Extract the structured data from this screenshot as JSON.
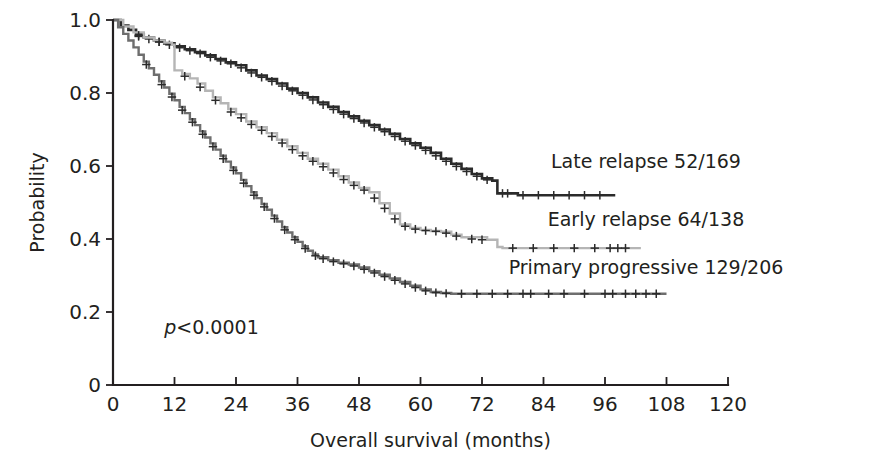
{
  "chart_data": {
    "type": "line",
    "subtype": "kaplan-meier-survival",
    "title": "",
    "xlabel": "Overall survival (months)",
    "ylabel": "Probability",
    "xlim": [
      0,
      120
    ],
    "ylim": [
      0,
      1.0
    ],
    "xticks": [
      0,
      12,
      24,
      36,
      48,
      60,
      72,
      84,
      96,
      108,
      120
    ],
    "xticklabels": [
      "0",
      "12",
      "24",
      "36",
      "48",
      "60",
      "72",
      "84",
      "96",
      "108",
      "120"
    ],
    "yticks": [
      0,
      0.2,
      0.4,
      0.6,
      0.8,
      1.0
    ],
    "yticklabels": [
      "0",
      "0.2",
      "0.4",
      "0.6",
      "0.8",
      "1.0"
    ],
    "grid": false,
    "legend_position": "right-inline",
    "annotations": [
      {
        "name": "p-value",
        "text_prefix": "p",
        "text_rest": "<0.0001",
        "x": 10,
        "y": 0.14
      }
    ],
    "series": [
      {
        "name": "Late relapse",
        "label": "Late relapse 52/169",
        "events": 52,
        "total": 169,
        "color": "#2b2b2b",
        "width": 2.6,
        "label_x": 104,
        "label_y": 0.595,
        "steps": [
          [
            0,
            1.0
          ],
          [
            1.5,
            0.985
          ],
          [
            3,
            0.973
          ],
          [
            4.5,
            0.962
          ],
          [
            6,
            0.952
          ],
          [
            8,
            0.944
          ],
          [
            10,
            0.936
          ],
          [
            12,
            0.928
          ],
          [
            14,
            0.92
          ],
          [
            16,
            0.912
          ],
          [
            18,
            0.903
          ],
          [
            20,
            0.893
          ],
          [
            22,
            0.884
          ],
          [
            24,
            0.876
          ],
          [
            26,
            0.862
          ],
          [
            28,
            0.848
          ],
          [
            30,
            0.838
          ],
          [
            32,
            0.826
          ],
          [
            34,
            0.812
          ],
          [
            36,
            0.8
          ],
          [
            38,
            0.788
          ],
          [
            40,
            0.774
          ],
          [
            42,
            0.762
          ],
          [
            44,
            0.748
          ],
          [
            46,
            0.736
          ],
          [
            48,
            0.724
          ],
          [
            50,
            0.712
          ],
          [
            52,
            0.7
          ],
          [
            54,
            0.688
          ],
          [
            56,
            0.674
          ],
          [
            58,
            0.662
          ],
          [
            60,
            0.65
          ],
          [
            62,
            0.636
          ],
          [
            64,
            0.62
          ],
          [
            66,
            0.606
          ],
          [
            68,
            0.592
          ],
          [
            70,
            0.578
          ],
          [
            72,
            0.566
          ],
          [
            74,
            0.56
          ],
          [
            75,
            0.525
          ],
          [
            78,
            0.525
          ],
          [
            79,
            0.52
          ],
          [
            98,
            0.52
          ]
        ],
        "censors": [
          [
            5,
            0.955
          ],
          [
            7,
            0.948
          ],
          [
            9,
            0.94
          ],
          [
            11,
            0.932
          ],
          [
            13,
            0.924
          ],
          [
            15,
            0.916
          ],
          [
            17,
            0.908
          ],
          [
            19,
            0.898
          ],
          [
            21,
            0.888
          ],
          [
            23,
            0.88
          ],
          [
            25,
            0.869
          ],
          [
            27,
            0.855
          ],
          [
            29,
            0.843
          ],
          [
            31,
            0.832
          ],
          [
            33,
            0.819
          ],
          [
            35,
            0.806
          ],
          [
            37,
            0.794
          ],
          [
            39,
            0.781
          ],
          [
            41,
            0.768
          ],
          [
            43,
            0.755
          ],
          [
            45,
            0.742
          ],
          [
            47,
            0.73
          ],
          [
            49,
            0.718
          ],
          [
            51,
            0.706
          ],
          [
            53,
            0.694
          ],
          [
            55,
            0.681
          ],
          [
            57,
            0.668
          ],
          [
            59,
            0.656
          ],
          [
            61,
            0.643
          ],
          [
            63,
            0.628
          ],
          [
            65,
            0.613
          ],
          [
            67,
            0.599
          ],
          [
            69,
            0.585
          ],
          [
            71,
            0.572
          ],
          [
            73,
            0.562
          ],
          [
            76,
            0.525
          ],
          [
            77,
            0.525
          ],
          [
            80,
            0.52
          ],
          [
            83,
            0.52
          ],
          [
            86,
            0.52
          ],
          [
            89,
            0.52
          ],
          [
            92,
            0.52
          ],
          [
            95,
            0.52
          ]
        ]
      },
      {
        "name": "Early relapse",
        "label": "Early relapse 64/138",
        "events": 64,
        "total": 138,
        "color": "#b5b5b5",
        "width": 2.4,
        "label_x": 104,
        "label_y": 0.435,
        "steps": [
          [
            0,
            1.0
          ],
          [
            2,
            0.982
          ],
          [
            4,
            0.966
          ],
          [
            6,
            0.952
          ],
          [
            8,
            0.944
          ],
          [
            10,
            0.938
          ],
          [
            11.5,
            0.932
          ],
          [
            12,
            0.862
          ],
          [
            13.5,
            0.852
          ],
          [
            15,
            0.84
          ],
          [
            16.5,
            0.826
          ],
          [
            18,
            0.806
          ],
          [
            19.5,
            0.788
          ],
          [
            21,
            0.772
          ],
          [
            22.5,
            0.756
          ],
          [
            24,
            0.742
          ],
          [
            26,
            0.722
          ],
          [
            28,
            0.706
          ],
          [
            30,
            0.69
          ],
          [
            32,
            0.672
          ],
          [
            34,
            0.654
          ],
          [
            36,
            0.636
          ],
          [
            38,
            0.62
          ],
          [
            40,
            0.606
          ],
          [
            42,
            0.59
          ],
          [
            44,
            0.572
          ],
          [
            46,
            0.555
          ],
          [
            48,
            0.54
          ],
          [
            50,
            0.528
          ],
          [
            52,
            0.498
          ],
          [
            54,
            0.47
          ],
          [
            56,
            0.44
          ],
          [
            58,
            0.43
          ],
          [
            60,
            0.425
          ],
          [
            62,
            0.422
          ],
          [
            64,
            0.42
          ],
          [
            66,
            0.412
          ],
          [
            68,
            0.405
          ],
          [
            73,
            0.398
          ],
          [
            75,
            0.378
          ],
          [
            76,
            0.375
          ],
          [
            103,
            0.375
          ]
        ],
        "censors": [
          [
            5,
            0.958
          ],
          [
            9,
            0.94
          ],
          [
            14,
            0.846
          ],
          [
            17,
            0.816
          ],
          [
            20,
            0.78
          ],
          [
            23,
            0.748
          ],
          [
            25,
            0.732
          ],
          [
            27,
            0.714
          ],
          [
            29,
            0.698
          ],
          [
            31,
            0.681
          ],
          [
            33,
            0.663
          ],
          [
            35,
            0.645
          ],
          [
            37,
            0.628
          ],
          [
            39,
            0.613
          ],
          [
            41,
            0.598
          ],
          [
            43,
            0.581
          ],
          [
            45,
            0.563
          ],
          [
            47,
            0.547
          ],
          [
            49,
            0.534
          ],
          [
            51,
            0.512
          ],
          [
            53,
            0.484
          ],
          [
            55,
            0.455
          ],
          [
            57,
            0.435
          ],
          [
            59,
            0.427
          ],
          [
            61,
            0.423
          ],
          [
            63,
            0.421
          ],
          [
            65,
            0.416
          ],
          [
            67,
            0.408
          ],
          [
            70,
            0.4
          ],
          [
            72,
            0.398
          ],
          [
            78,
            0.375
          ],
          [
            82,
            0.375
          ],
          [
            86,
            0.375
          ],
          [
            90,
            0.375
          ],
          [
            94,
            0.375
          ],
          [
            97,
            0.375
          ],
          [
            98.5,
            0.375
          ],
          [
            100,
            0.375
          ]
        ]
      },
      {
        "name": "Primary progressive",
        "label": "Primary progressive 129/206",
        "events": 129,
        "total": 206,
        "color": "#6e6e6e",
        "width": 2.4,
        "label_x": 104,
        "label_y": 0.305,
        "steps": [
          [
            0,
            1.0
          ],
          [
            1,
            0.98
          ],
          [
            2,
            0.962
          ],
          [
            3,
            0.944
          ],
          [
            4,
            0.925
          ],
          [
            5,
            0.905
          ],
          [
            6,
            0.886
          ],
          [
            7,
            0.868
          ],
          [
            8,
            0.85
          ],
          [
            9,
            0.832
          ],
          [
            10,
            0.815
          ],
          [
            11,
            0.798
          ],
          [
            12,
            0.78
          ],
          [
            13,
            0.762
          ],
          [
            14,
            0.745
          ],
          [
            15,
            0.728
          ],
          [
            16,
            0.712
          ],
          [
            17,
            0.695
          ],
          [
            18,
            0.678
          ],
          [
            19,
            0.662
          ],
          [
            20,
            0.645
          ],
          [
            21,
            0.628
          ],
          [
            22,
            0.612
          ],
          [
            23,
            0.596
          ],
          [
            24,
            0.58
          ],
          [
            25,
            0.562
          ],
          [
            26,
            0.545
          ],
          [
            27,
            0.528
          ],
          [
            28,
            0.512
          ],
          [
            29,
            0.496
          ],
          [
            30,
            0.48
          ],
          [
            31,
            0.464
          ],
          [
            32,
            0.448
          ],
          [
            33,
            0.432
          ],
          [
            34,
            0.418
          ],
          [
            35,
            0.405
          ],
          [
            36,
            0.392
          ],
          [
            37,
            0.38
          ],
          [
            38,
            0.368
          ],
          [
            39,
            0.358
          ],
          [
            40,
            0.35
          ],
          [
            42,
            0.342
          ],
          [
            44,
            0.335
          ],
          [
            46,
            0.33
          ],
          [
            48,
            0.322
          ],
          [
            50,
            0.312
          ],
          [
            52,
            0.302
          ],
          [
            54,
            0.292
          ],
          [
            56,
            0.282
          ],
          [
            58,
            0.272
          ],
          [
            60,
            0.262
          ],
          [
            62,
            0.255
          ],
          [
            64,
            0.252
          ],
          [
            66,
            0.25
          ],
          [
            108,
            0.25
          ]
        ],
        "censors": [
          [
            6.5,
            0.878
          ],
          [
            9.5,
            0.823
          ],
          [
            11.5,
            0.789
          ],
          [
            13.5,
            0.753
          ],
          [
            15.5,
            0.72
          ],
          [
            17.5,
            0.687
          ],
          [
            19.5,
            0.653
          ],
          [
            21.5,
            0.62
          ],
          [
            23.5,
            0.588
          ],
          [
            25.5,
            0.553
          ],
          [
            27.5,
            0.52
          ],
          [
            29.5,
            0.488
          ],
          [
            31.5,
            0.456
          ],
          [
            33.5,
            0.425
          ],
          [
            35.5,
            0.398
          ],
          [
            37.5,
            0.374
          ],
          [
            39.5,
            0.354
          ],
          [
            41,
            0.346
          ],
          [
            43,
            0.338
          ],
          [
            45,
            0.332
          ],
          [
            47,
            0.326
          ],
          [
            49,
            0.317
          ],
          [
            51,
            0.307
          ],
          [
            53,
            0.297
          ],
          [
            55,
            0.287
          ],
          [
            57,
            0.277
          ],
          [
            59,
            0.267
          ],
          [
            61,
            0.258
          ],
          [
            63,
            0.253
          ],
          [
            65,
            0.251
          ],
          [
            68,
            0.25
          ],
          [
            71,
            0.25
          ],
          [
            74,
            0.25
          ],
          [
            77,
            0.25
          ],
          [
            80,
            0.25
          ],
          [
            81.5,
            0.25
          ],
          [
            85,
            0.25
          ],
          [
            88,
            0.25
          ],
          [
            92,
            0.25
          ],
          [
            96,
            0.25
          ],
          [
            97.5,
            0.25
          ],
          [
            100,
            0.25
          ],
          [
            102,
            0.25
          ],
          [
            104,
            0.25
          ],
          [
            106,
            0.25
          ]
        ]
      }
    ]
  },
  "axes": {
    "y_title": "Probability",
    "x_title": "Overall survival (months)"
  }
}
